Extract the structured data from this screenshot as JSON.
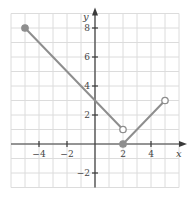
{
  "chart_data": {
    "type": "line",
    "title": "",
    "xlabel": "x",
    "ylabel": "y",
    "xlim": [
      -6,
      6
    ],
    "ylim": [
      -3,
      9
    ],
    "grid": true,
    "x_ticks": [
      -4,
      -2,
      2,
      4
    ],
    "y_ticks": [
      -2,
      2,
      4,
      6,
      8
    ],
    "x_tick_labels": [
      "−4",
      "−2",
      "2",
      "4"
    ],
    "y_tick_labels": [
      "−2",
      "2",
      "4",
      "6",
      "8"
    ],
    "series": [
      {
        "name": "segment-1",
        "points": [
          [
            -5,
            8
          ],
          [
            2,
            1
          ]
        ],
        "endpoints": [
          {
            "x": -5,
            "y": 8,
            "style": "closed"
          },
          {
            "x": 2,
            "y": 1,
            "style": "open"
          }
        ]
      },
      {
        "name": "segment-2",
        "points": [
          [
            2,
            0
          ],
          [
            5,
            3
          ]
        ],
        "endpoints": [
          {
            "x": 2,
            "y": 0,
            "style": "closed"
          },
          {
            "x": 5,
            "y": 3,
            "style": "open"
          }
        ]
      }
    ],
    "colors": {
      "line": "#8e8e8e",
      "grid": "#dcdcdc",
      "axis": "#3a3a3a"
    }
  }
}
